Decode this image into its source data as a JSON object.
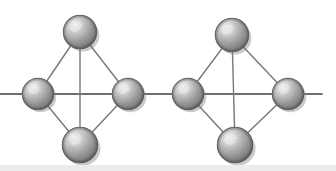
{
  "figure": {
    "width": 336,
    "height": 171,
    "background_color": "#ffffff"
  },
  "style": {
    "bond_color": "#777777",
    "bond_width": 1.4,
    "axis_color": "#6f6f6f",
    "axis_width": 1.8,
    "sphere_outline_color": "#5e5e5e",
    "sphere_outline_width": 1.1,
    "sphere_highlight_color": "#f2f2f2",
    "sphere_mid_color": "#b4b4b4",
    "sphere_base_color": "#8d8d8d",
    "sphere_shadow_color": "#6a6a6a",
    "speckle_color": "#5a5a5a",
    "scan_band_color": "#ececec"
  },
  "axis": {
    "name": "horizontal-axis",
    "y": 94,
    "x_start": 0,
    "x_end": 322
  },
  "clusters": [
    {
      "id": "left-cluster",
      "label": "Left rhombic cluster",
      "center_x": 83,
      "atoms": [
        {
          "id": "left-top",
          "label": "top atom",
          "cx": 80,
          "cy": 32,
          "r": 17
        },
        {
          "id": "left-west",
          "label": "left atom",
          "cx": 38,
          "cy": 94,
          "r": 16
        },
        {
          "id": "left-east",
          "label": "right atom",
          "cx": 128,
          "cy": 94,
          "r": 16
        },
        {
          "id": "left-bottom",
          "label": "bottom atom",
          "cx": 80,
          "cy": 145,
          "r": 18
        }
      ],
      "bonds": [
        {
          "id": "l-b1",
          "x1": 80,
          "y1": 32,
          "x2": 38,
          "y2": 94
        },
        {
          "id": "l-b2",
          "x1": 80,
          "y1": 32,
          "x2": 128,
          "y2": 94
        },
        {
          "id": "l-b3",
          "x1": 38,
          "y1": 94,
          "x2": 80,
          "y2": 145
        },
        {
          "id": "l-b4",
          "x1": 128,
          "y1": 94,
          "x2": 80,
          "y2": 145
        },
        {
          "id": "l-b5",
          "x1": 80,
          "y1": 32,
          "x2": 80,
          "y2": 145
        }
      ]
    },
    {
      "id": "right-cluster",
      "label": "Right rhombic cluster",
      "center_x": 238,
      "atoms": [
        {
          "id": "right-top",
          "label": "top atom",
          "cx": 232,
          "cy": 35,
          "r": 17
        },
        {
          "id": "right-west",
          "label": "left atom",
          "cx": 188,
          "cy": 94,
          "r": 16
        },
        {
          "id": "right-east",
          "label": "right atom",
          "cx": 288,
          "cy": 94,
          "r": 16
        },
        {
          "id": "right-bottom",
          "label": "bottom atom",
          "cx": 235,
          "cy": 145,
          "r": 18
        }
      ],
      "bonds": [
        {
          "id": "r-b1",
          "x1": 232,
          "y1": 35,
          "x2": 188,
          "y2": 94
        },
        {
          "id": "r-b2",
          "x1": 232,
          "y1": 35,
          "x2": 288,
          "y2": 94
        },
        {
          "id": "r-b3",
          "x1": 188,
          "y1": 94,
          "x2": 235,
          "y2": 145
        },
        {
          "id": "r-b4",
          "x1": 288,
          "y1": 94,
          "x2": 235,
          "y2": 145
        },
        {
          "id": "r-b5",
          "x1": 232,
          "y1": 35,
          "x2": 235,
          "y2": 145
        }
      ]
    }
  ],
  "scan_artifact": {
    "name": "bottom-scan-band",
    "top": 165,
    "height": 6,
    "color": "#ececec"
  }
}
